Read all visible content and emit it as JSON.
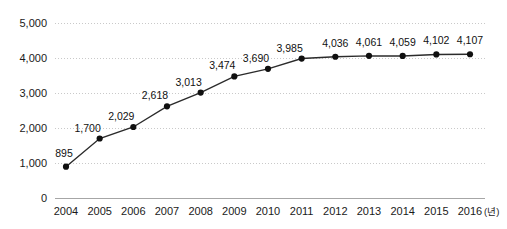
{
  "chart_data": {
    "type": "line",
    "title": "",
    "subtitle": "",
    "xlabel": "(년)",
    "ylabel": "",
    "categories": [
      "2004",
      "2005",
      "2006",
      "2007",
      "2008",
      "2009",
      "2010",
      "2011",
      "2012",
      "2013",
      "2014",
      "2015",
      "2016"
    ],
    "values": [
      895,
      1700,
      2029,
      2618,
      3013,
      3474,
      3690,
      3985,
      4036,
      4061,
      4059,
      4102,
      4107
    ],
    "data_labels": [
      "895",
      "1,700",
      "2,029",
      "2,618",
      "3,013",
      "3,474",
      "3,690",
      "3,985",
      "4,036",
      "4,061",
      "4,059",
      "4,102",
      "4,107"
    ],
    "series": [
      {
        "name": "",
        "values": [
          895,
          1700,
          2029,
          2618,
          3013,
          3474,
          3690,
          3985,
          4036,
          4061,
          4059,
          4102,
          4107
        ]
      }
    ],
    "ylim": [
      0,
      5000
    ],
    "yticks": [
      0,
      1000,
      2000,
      3000,
      4000,
      5000
    ],
    "ytick_labels": [
      "0",
      "1,000",
      "2,000",
      "3,000",
      "4,000",
      "5,000"
    ],
    "grid": true,
    "grid_axis": "y",
    "legend": false,
    "legend_position": "none",
    "marker": "circle",
    "line_color": "#2b2b2b",
    "marker_color": "#101010",
    "grid_color": "#c9c9c9",
    "axis_color": "#a6a6a6",
    "background_color": "#ffffff",
    "annotations": []
  },
  "axis": {
    "x_unit_label": "(년)"
  }
}
